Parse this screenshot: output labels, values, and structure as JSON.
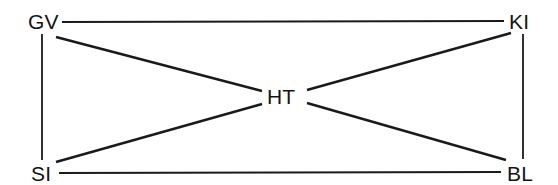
{
  "figure": {
    "type": "node-link-diagram",
    "background_color": "#ffffff",
    "line_color": "#1a1a1a",
    "text_color": "#141414",
    "width": 558,
    "height": 185
  },
  "nodes": [
    {
      "id": "GV",
      "label": "GV",
      "x": 42,
      "y": 21,
      "text_x": 28,
      "text_y": 29,
      "position": "top-left"
    },
    {
      "id": "KI",
      "label": "KI",
      "x": 523,
      "y": 21,
      "text_x": 509,
      "text_y": 29,
      "position": "top-right"
    },
    {
      "id": "HT",
      "label": "HT",
      "x": 284,
      "y": 96,
      "text_x": 267,
      "text_y": 104,
      "position": "center"
    },
    {
      "id": "SI",
      "label": "SI",
      "x": 42,
      "y": 173,
      "text_x": 31,
      "text_y": 181,
      "position": "bottom-left"
    },
    {
      "id": "BL",
      "label": "BL",
      "x": 523,
      "y": 173,
      "text_x": 507,
      "text_y": 181,
      "position": "bottom-right"
    }
  ],
  "edges": [
    {
      "id": "gv-ki",
      "from": "GV",
      "to": "KI",
      "x1": 62,
      "y1": 22,
      "x2": 504,
      "y2": 21,
      "width": 2.0,
      "style": "horizontal-top"
    },
    {
      "id": "si-bl",
      "from": "SI",
      "to": "BL",
      "x1": 59,
      "y1": 173,
      "x2": 501,
      "y2": 172,
      "width": 2.0,
      "style": "horizontal-bottom"
    },
    {
      "id": "gv-si",
      "from": "GV",
      "to": "SI",
      "x1": 42,
      "y1": 34,
      "x2": 42,
      "y2": 160,
      "width": 1.8,
      "style": "vertical-left"
    },
    {
      "id": "ki-bl",
      "from": "KI",
      "to": "BL",
      "x1": 523,
      "y1": 34,
      "x2": 523,
      "y2": 159,
      "width": 1.8,
      "style": "vertical-right"
    },
    {
      "id": "gv-ht",
      "from": "GV",
      "to": "HT",
      "x1": 56,
      "y1": 37,
      "x2": 262,
      "y2": 91,
      "width": 2.4,
      "style": "diagonal"
    },
    {
      "id": "si-ht",
      "from": "SI",
      "to": "HT",
      "x1": 56,
      "y1": 162,
      "x2": 262,
      "y2": 104,
      "width": 2.4,
      "style": "diagonal"
    },
    {
      "id": "ht-ki",
      "from": "HT",
      "to": "KI",
      "x1": 307,
      "y1": 90,
      "x2": 511,
      "y2": 33,
      "width": 2.4,
      "style": "diagonal"
    },
    {
      "id": "ht-bl",
      "from": "HT",
      "to": "BL",
      "x1": 307,
      "y1": 103,
      "x2": 506,
      "y2": 160,
      "width": 2.4,
      "style": "diagonal"
    }
  ]
}
